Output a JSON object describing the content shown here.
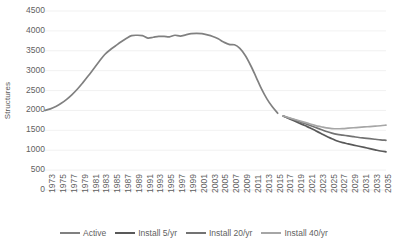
{
  "chart_data": {
    "type": "line",
    "title": "",
    "xlabel": "",
    "ylabel": "Structures",
    "ylim": [
      0,
      4500
    ],
    "ytick_step": 500,
    "yticks": [
      "0",
      "500",
      "1000",
      "1500",
      "2000",
      "2500",
      "3000",
      "3500",
      "4000",
      "4500"
    ],
    "xlim": [
      1973,
      2036
    ],
    "xticks": [
      "1973",
      "1975",
      "1977",
      "1979",
      "1981",
      "1983",
      "1985",
      "1987",
      "1989",
      "1991",
      "1993",
      "1995",
      "1997",
      "1999",
      "2001",
      "2003",
      "2005",
      "2007",
      "2009",
      "2011",
      "2013",
      "2015",
      "2017",
      "2019",
      "2021",
      "2023",
      "2025",
      "2027",
      "2029",
      "2031",
      "2033",
      "2035"
    ],
    "grid": "horizontal",
    "legend_position": "bottom",
    "series": [
      {
        "name": "Active",
        "color": "#808080",
        "x": [
          1973,
          1974,
          1975,
          1976,
          1977,
          1978,
          1979,
          1980,
          1981,
          1982,
          1983,
          1984,
          1985,
          1986,
          1987,
          1988,
          1989,
          1990,
          1991,
          1992,
          1993,
          1994,
          1995,
          1996,
          1997,
          1998,
          1999,
          2000,
          2001,
          2002,
          2003,
          2004,
          2005,
          2006,
          2007,
          2008,
          2009,
          2010,
          2011,
          2012,
          2013,
          2014,
          2015,
          2016
        ],
        "values": [
          2000,
          2040,
          2100,
          2180,
          2280,
          2400,
          2540,
          2700,
          2870,
          3050,
          3230,
          3400,
          3520,
          3620,
          3720,
          3810,
          3880,
          3890,
          3880,
          3820,
          3840,
          3860,
          3860,
          3850,
          3890,
          3870,
          3900,
          3930,
          3940,
          3930,
          3900,
          3860,
          3800,
          3720,
          3660,
          3650,
          3560,
          3380,
          3130,
          2840,
          2540,
          2290,
          2090,
          1930
        ]
      },
      {
        "name": "Install 5/yr",
        "color": "#595959",
        "x": [
          2017,
          2018,
          2019,
          2020,
          2021,
          2022,
          2023,
          2024,
          2025,
          2026,
          2027,
          2028,
          2029,
          2030,
          2031,
          2032,
          2033,
          2034,
          2035,
          2036
        ],
        "values": [
          1860,
          1800,
          1740,
          1680,
          1620,
          1560,
          1490,
          1420,
          1350,
          1290,
          1230,
          1190,
          1160,
          1130,
          1100,
          1070,
          1040,
          1010,
          980,
          960
        ]
      },
      {
        "name": "Install 20/yr",
        "color": "#737373",
        "x": [
          2017,
          2018,
          2019,
          2020,
          2021,
          2022,
          2023,
          2024,
          2025,
          2026,
          2027,
          2028,
          2029,
          2030,
          2031,
          2032,
          2033,
          2034,
          2035,
          2036
        ],
        "values": [
          1860,
          1810,
          1770,
          1720,
          1670,
          1620,
          1570,
          1520,
          1470,
          1430,
          1400,
          1380,
          1360,
          1340,
          1320,
          1305,
          1290,
          1275,
          1260,
          1250
        ]
      },
      {
        "name": "Install 40/yr",
        "color": "#a6a6a6",
        "x": [
          2017,
          2018,
          2019,
          2020,
          2021,
          2022,
          2023,
          2024,
          2025,
          2026,
          2027,
          2028,
          2029,
          2030,
          2031,
          2032,
          2033,
          2034,
          2035,
          2036
        ],
        "values": [
          1860,
          1820,
          1780,
          1740,
          1700,
          1660,
          1620,
          1590,
          1560,
          1545,
          1540,
          1545,
          1555,
          1565,
          1575,
          1585,
          1595,
          1605,
          1615,
          1630
        ]
      }
    ]
  },
  "legend": {
    "items": [
      {
        "label": "Active",
        "color": "#808080"
      },
      {
        "label": "Install 5/yr",
        "color": "#595959"
      },
      {
        "label": "Install 20/yr",
        "color": "#737373"
      },
      {
        "label": "Install 40/yr",
        "color": "#a6a6a6"
      }
    ]
  },
  "style": {
    "grid_color": "#ededed",
    "text_color": "#5f5f5f",
    "background": "#ffffff"
  }
}
